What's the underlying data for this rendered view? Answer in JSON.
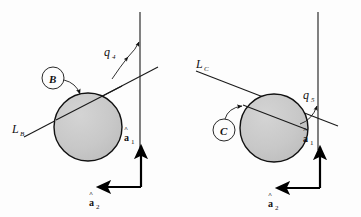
{
  "figure": {
    "background_color": "#fdfdfd",
    "ink_color": "#111111",
    "sphere_fill_color": "#c9c9c9",
    "sphere_stroke_color": "#111111",
    "width": 361,
    "height": 217
  },
  "panels": [
    {
      "id": "left",
      "body_label": "B",
      "line_label": "L",
      "line_label_sub": "B",
      "angle_label": "q",
      "angle_label_sub": "4",
      "axis1_label": "a",
      "axis1_label_sub": "1",
      "axis2_label": "a",
      "axis2_label_sub": "2"
    },
    {
      "id": "right",
      "body_label": "C",
      "line_label": "L",
      "line_label_sub": "C",
      "angle_label": "q",
      "angle_label_sub": "5",
      "axis1_label": "a",
      "axis1_label_sub": "1",
      "axis2_label": "a",
      "axis2_label_sub": "2"
    }
  ],
  "icons": {
    "sphere": "shaded-sphere-icon",
    "callout_arrow": "curved-callout-arrow-icon",
    "angle_arc_arrow": "angle-arc-arrow-icon",
    "axis_arrow": "axis-arrow-icon"
  }
}
